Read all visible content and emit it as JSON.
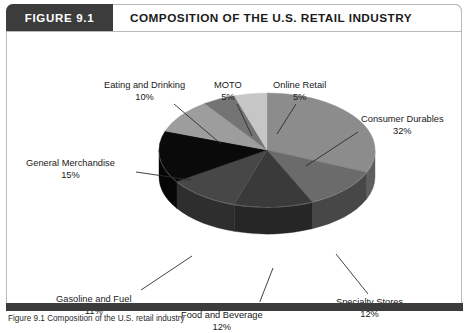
{
  "figure": {
    "number_label": "FIGURE 9.1",
    "title": "COMPOSITION OF THE U.S. RETAIL INDUSTRY",
    "source_caption": "Figure 9.1 Composition of the U.S. retail industry"
  },
  "colors": {
    "frame_border": "#b9b9b9",
    "header_box": "#3c3c3c",
    "header_text": "#ffffff",
    "title_text": "#1b1b1b",
    "bottom_bar": "#3c3c3c",
    "label_text": "#202020",
    "leader_line": "#2b2b2b"
  },
  "chart_data": {
    "type": "pie",
    "title": "COMPOSITION OF THE U.S. RETAIL INDUSTRY",
    "xlabel": "",
    "ylabel": "",
    "units": "percent",
    "legend": "none",
    "grid": false,
    "three_d": true,
    "categories": [
      "Consumer Durables",
      "Specialty Stores",
      "Food and Beverage",
      "Gasoline and Fuel",
      "General Merchandise",
      "Eating and Drinking",
      "MOTO",
      "Online Retail"
    ],
    "values": [
      32,
      12,
      12,
      11,
      15,
      10,
      5,
      5
    ],
    "slices": [
      {
        "label": "Consumer Durables",
        "pct": "32%",
        "value": 32,
        "color": "#8c8c8c",
        "side_color": "#5e5e5e",
        "label_x": 355,
        "label_y": 82,
        "leader": [
          352,
          100,
          300,
          134
        ]
      },
      {
        "label": "Specialty Stores",
        "pct": "12%",
        "value": 12,
        "color": "#6b6b6b",
        "side_color": "#474747",
        "label_x": 330,
        "label_y": 265,
        "leader": [
          362,
          262,
          330,
          222
        ]
      },
      {
        "label": "Food and Beverage",
        "pct": "12%",
        "value": 12,
        "color": "#3a3a3a",
        "side_color": "#262626",
        "label_x": 175,
        "label_y": 278,
        "leader": [
          253,
          272,
          267,
          236
        ]
      },
      {
        "label": "Gasoline and Fuel",
        "pct": "11%",
        "value": 11,
        "color": "#474747",
        "side_color": "#2e2e2e",
        "label_x": 50,
        "label_y": 262,
        "leader": [
          135,
          258,
          186,
          224
        ]
      },
      {
        "label": "General Merchandise",
        "pct": "15%",
        "value": 15,
        "color": "#0a0a0a",
        "side_color": "#060606",
        "label_x": 20,
        "label_y": 126,
        "leader": [
          130,
          140,
          185,
          148
        ]
      },
      {
        "label": "Eating and Drinking",
        "pct": "10%",
        "value": 10,
        "color": "#9d9d9d",
        "side_color": "#6b6b6b",
        "label_x": 98,
        "label_y": 48,
        "leader": [
          168,
          72,
          215,
          112
        ]
      },
      {
        "label": "MOTO",
        "pct": "5%",
        "value": 5,
        "color": "#747474",
        "side_color": "#4e4e4e",
        "label_x": 208,
        "label_y": 48,
        "leader": [
          231,
          72,
          246,
          104
        ]
      },
      {
        "label": "Online Retail",
        "pct": "5%",
        "value": 5,
        "color": "#c6c6c6",
        "side_color": "#8e8e8e",
        "label_x": 267,
        "label_y": 48,
        "leader": [
          290,
          72,
          271,
          102
        ]
      }
    ]
  }
}
